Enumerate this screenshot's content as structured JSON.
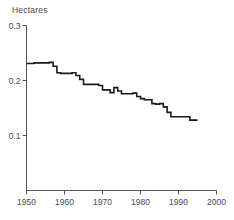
{
  "chart_data": {
    "type": "line",
    "title": "",
    "subtitle": "",
    "xlabel": "",
    "ylabel": "Hectares",
    "ylabel_position": "top-left",
    "xlim": [
      1950,
      2000
    ],
    "ylim": [
      0,
      0.3
    ],
    "xticks": [
      1950,
      1960,
      1970,
      1980,
      1990,
      2000
    ],
    "xtick_labels": [
      "1950",
      "1960",
      "1970",
      "1980",
      "1990",
      "2000"
    ],
    "yticks": [
      0.1,
      0.2,
      0.3
    ],
    "ytick_labels": [
      "0.1",
      "0.2",
      "0.3"
    ],
    "grid": false,
    "legend": null,
    "line_color": "#1a1a1a",
    "line_style": "stepped",
    "axis_color": "#555555",
    "background": "#ffffff",
    "series": [
      {
        "name": "Hectares per capita",
        "x": [
          1950,
          1951,
          1952,
          1953,
          1954,
          1955,
          1956,
          1957,
          1958,
          1959,
          1960,
          1961,
          1962,
          1963,
          1964,
          1965,
          1966,
          1967,
          1968,
          1969,
          1970,
          1971,
          1972,
          1973,
          1974,
          1975,
          1976,
          1977,
          1978,
          1979,
          1980,
          1981,
          1982,
          1983,
          1984,
          1985,
          1986,
          1987,
          1988,
          1989,
          1990,
          1991,
          1992,
          1993,
          1994,
          1995
        ],
        "values": [
          0.231,
          0.231,
          0.232,
          0.232,
          0.232,
          0.232,
          0.233,
          0.226,
          0.214,
          0.213,
          0.213,
          0.213,
          0.214,
          0.209,
          0.202,
          0.193,
          0.193,
          0.193,
          0.193,
          0.191,
          0.183,
          0.183,
          0.178,
          0.187,
          0.181,
          0.176,
          0.176,
          0.176,
          0.177,
          0.171,
          0.167,
          0.165,
          0.165,
          0.158,
          0.157,
          0.158,
          0.152,
          0.142,
          0.134,
          0.134,
          0.134,
          0.134,
          0.134,
          0.128,
          0.128,
          0.128
        ]
      }
    ]
  },
  "axis": {
    "y_axis_name": "Hectares",
    "x_axis_name": ""
  },
  "caption": {
    "text": ""
  }
}
